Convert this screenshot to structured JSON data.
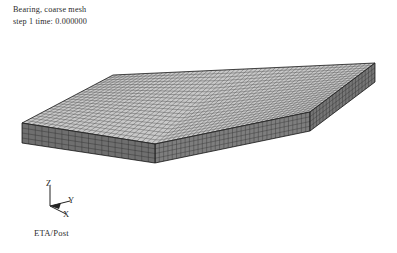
{
  "app": {
    "name": "ETA/Post",
    "logo_label": "ETA/Post",
    "background_color": "#ffffff"
  },
  "title_block": {
    "line1": "Bearing, coarse mesh",
    "line2": "step 1 time: 0.000000",
    "text_color": "#2b2b2b"
  },
  "model": {
    "description": "Bearing coarse mesh - rectangular slab, isometric view",
    "top_face_color": "#c8c8c8",
    "front_face_color": "#808080",
    "left_face_color": "#6e6e6e",
    "mesh_line_color": "#3a3a3a",
    "outline_color": "#1f1f1f",
    "geometry": {
      "top_left": [
        22,
        123
      ],
      "top_back_left": [
        113,
        75
      ],
      "top_back_right": [
        375,
        63
      ],
      "top_front_right": [
        310,
        112
      ],
      "top_front_left": [
        155,
        144
      ],
      "bottom_left": [
        22,
        143
      ],
      "bottom_front_left": [
        155,
        163
      ],
      "bottom_front_right": [
        310,
        131
      ],
      "bottom_back_right": [
        375,
        82
      ]
    },
    "mesh_divisions": {
      "length": 58,
      "width": 20,
      "thickness": 4
    }
  },
  "axis_triad": {
    "z_label": "Z",
    "y_label": "Y",
    "x_label": "X",
    "line_color": "#232323",
    "origin": [
      22,
      28
    ]
  }
}
